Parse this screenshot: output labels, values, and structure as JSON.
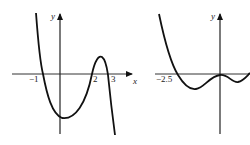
{
  "figure": {
    "left_graph": {
      "x_axis_label": "x",
      "y_axis_label": "y",
      "tick_labels": [
        "−1",
        "2",
        "3"
      ],
      "description": "Polynomial curve with roots at -1, 2, 3; double behaviour near 2-3 hump"
    },
    "right_graph": {
      "y_axis_label": "y",
      "tick_labels": [
        "−2.5"
      ],
      "description": "Polynomial curve crossing at -2.5, touching at 0"
    }
  },
  "colors": {
    "stroke": "#111111",
    "background": "#ffffff"
  }
}
